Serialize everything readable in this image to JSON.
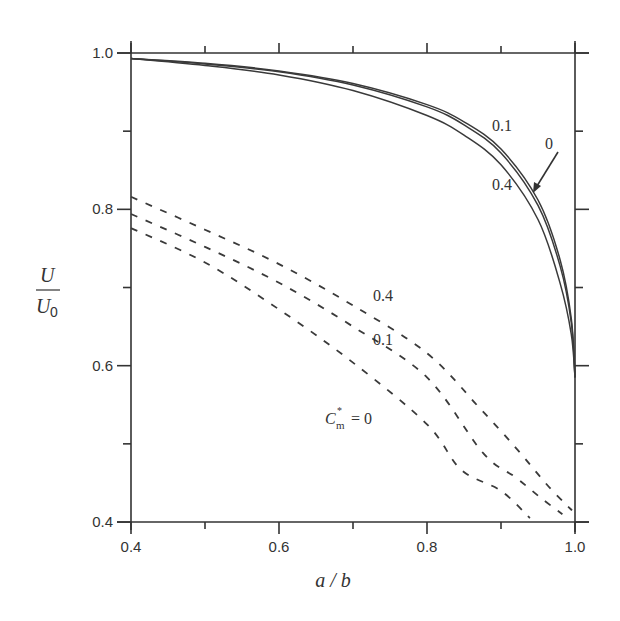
{
  "chart_data": {
    "type": "line",
    "title": "",
    "xlabel": "a / b",
    "ylabel": "U / U0",
    "ylabel_parts": {
      "numerator": "U",
      "denominator": "U",
      "denominator_sub": "0"
    },
    "xlim": [
      0.4,
      1.0
    ],
    "ylim": [
      0.4,
      1.0
    ],
    "grid": false,
    "x_ticks": [
      0.4,
      0.6,
      0.8,
      1.0
    ],
    "x_tick_labels": [
      "0.4",
      "0.6",
      "0.8",
      "1.0"
    ],
    "x_minor_ticks": [
      0.5,
      0.7,
      0.9
    ],
    "y_ticks": [
      0.4,
      0.6,
      0.8,
      1.0
    ],
    "y_tick_labels": [
      "0.4",
      "0.6",
      "0.8",
      "1.0"
    ],
    "y_minor_ticks": [
      0.5,
      0.7,
      0.9
    ],
    "legend": "none (curves labeled inline)",
    "parameter_label": "C*m = 0",
    "series": [
      {
        "name": "solid C*m=0",
        "style": "solid",
        "x": [
          0.4,
          0.5,
          0.6,
          0.7,
          0.8,
          0.85,
          0.9,
          0.95,
          0.98,
          0.995,
          1.0
        ],
        "y": [
          0.993,
          0.987,
          0.977,
          0.961,
          0.934,
          0.912,
          0.877,
          0.812,
          0.735,
          0.66,
          0.585
        ]
      },
      {
        "name": "solid C*m=0.1",
        "style": "solid",
        "x": [
          0.4,
          0.5,
          0.6,
          0.7,
          0.8,
          0.85,
          0.9,
          0.95,
          0.98,
          0.995,
          1.0
        ],
        "y": [
          0.993,
          0.986,
          0.976,
          0.959,
          0.931,
          0.908,
          0.872,
          0.805,
          0.727,
          0.655,
          0.585
        ]
      },
      {
        "name": "solid C*m=0.4",
        "style": "solid",
        "x": [
          0.4,
          0.5,
          0.6,
          0.7,
          0.8,
          0.85,
          0.9,
          0.95,
          0.98,
          0.995,
          1.0
        ],
        "y": [
          0.993,
          0.984,
          0.972,
          0.952,
          0.92,
          0.895,
          0.857,
          0.787,
          0.705,
          0.64,
          0.585
        ]
      },
      {
        "name": "dashed C*m=0.4",
        "style": "dashed",
        "x": [
          0.4,
          0.5,
          0.6,
          0.7,
          0.8,
          0.87,
          0.92,
          0.96,
          0.985,
          0.996
        ],
        "y": [
          0.816,
          0.774,
          0.73,
          0.677,
          0.616,
          0.547,
          0.495,
          0.45,
          0.425,
          0.415
        ]
      },
      {
        "name": "dashed C*m=0.1",
        "style": "dashed",
        "x": [
          0.4,
          0.5,
          0.6,
          0.7,
          0.8,
          0.876,
          0.92,
          0.955,
          0.983
        ],
        "y": [
          0.794,
          0.752,
          0.706,
          0.65,
          0.585,
          0.488,
          0.457,
          0.43,
          0.41
        ]
      },
      {
        "name": "dashed C*m=0",
        "style": "dashed",
        "x": [
          0.4,
          0.5,
          0.6,
          0.7,
          0.8,
          0.846,
          0.9,
          0.939
        ],
        "y": [
          0.776,
          0.732,
          0.672,
          0.604,
          0.525,
          0.467,
          0.44,
          0.405
        ]
      }
    ],
    "annotations": [
      {
        "text": "0.1",
        "near": "solid curve",
        "x": 0.88,
        "y": 0.91
      },
      {
        "text": "0",
        "near": "solid curve with arrow",
        "x": 0.955,
        "y": 0.885
      },
      {
        "text": "0.4",
        "near": "solid curve",
        "x": 0.88,
        "y": 0.835
      },
      {
        "text": "0.4",
        "near": "dashed curve",
        "x": 0.735,
        "y": 0.68
      },
      {
        "text": "0.1",
        "near": "dashed curve",
        "x": 0.735,
        "y": 0.625
      },
      {
        "text": "C*m = 0",
        "near": "dashed curve",
        "x": 0.68,
        "y": 0.53
      }
    ]
  },
  "labels": {
    "x_axis_title": "a / b",
    "y_axis_numerator": "U",
    "y_axis_denominator": "U",
    "y_axis_denominator_sub": "0",
    "solid_01": "0.1",
    "solid_0": "0",
    "solid_04": "0.4",
    "dashed_04": "0.4",
    "dashed_01": "0.1",
    "cm_symbol": "C",
    "cm_sup": "*",
    "cm_sub": "m",
    "cm_value": "= 0"
  }
}
